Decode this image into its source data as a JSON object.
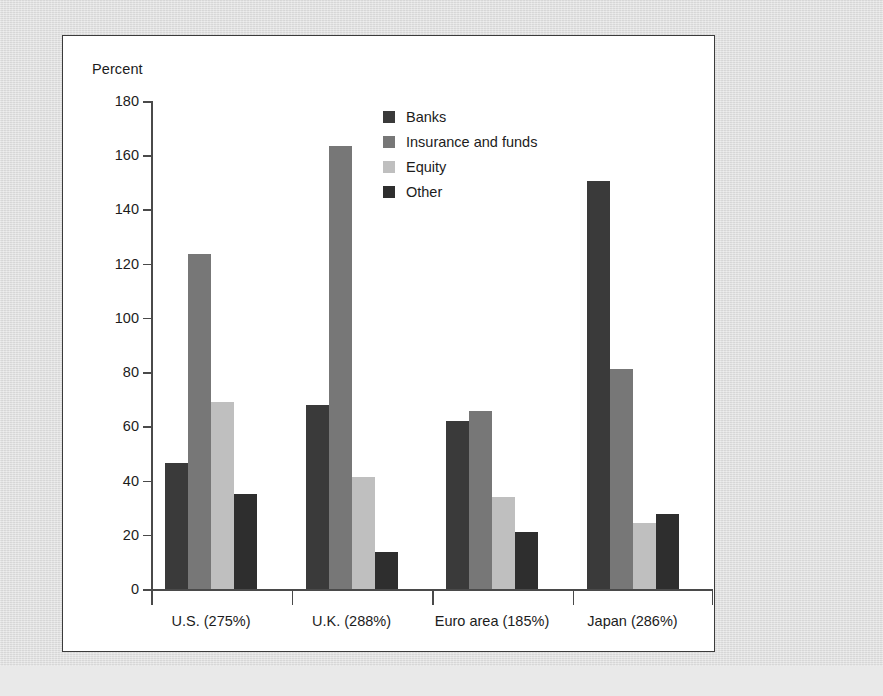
{
  "chart_data": {
    "type": "bar",
    "title": "",
    "subtitle": "",
    "xlabel": "",
    "ylabel": "Percent",
    "ylim": [
      0,
      180
    ],
    "ytick_step": 20,
    "yticks": [
      180,
      160,
      140,
      120,
      100,
      80,
      60,
      40,
      20,
      0
    ],
    "grid": false,
    "legend_position": "inside-top-center",
    "categories": [
      "U.S. (275%)",
      "U.K. (288%)",
      "Euro area (185%)",
      "Japan (286%)"
    ],
    "series": [
      {
        "name": "Banks",
        "color": "#3a3a3a",
        "values": [
          46.5,
          68.0,
          62.0,
          150.5
        ]
      },
      {
        "name": "Insurance and funds",
        "color": "#777777",
        "values": [
          123.5,
          163.5,
          65.5,
          81.0
        ]
      },
      {
        "name": "Equity",
        "color": "#bfbfbf",
        "values": [
          69.0,
          41.5,
          34.0,
          24.5
        ]
      },
      {
        "name": "Other",
        "color": "#2e2e2e",
        "values": [
          35.0,
          13.5,
          21.0,
          27.5
        ]
      }
    ]
  },
  "colors": {
    "page_background": "#dcdcdc",
    "panel_background": "#ffffff",
    "panel_border": "#3b3b3b",
    "axis": "#4a4a4a",
    "text": "#1c1c1c"
  }
}
